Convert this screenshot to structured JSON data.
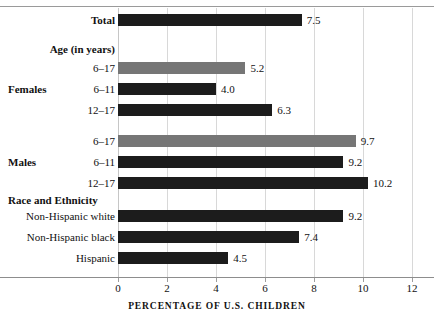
{
  "chart_data": {
    "type": "bar",
    "orientation": "horizontal",
    "title": "",
    "xlabel": "PERCENTAGE OF U.S. CHILDREN",
    "ylabel": "",
    "xlim": [
      0,
      12
    ],
    "xticks": [
      0,
      2,
      4,
      6,
      8,
      10,
      12
    ],
    "xtick_labels": [
      "0",
      "2",
      "4",
      "6",
      "8",
      "10",
      "12"
    ],
    "grid": true,
    "grid_axis": "x",
    "legend": "none",
    "colors": {
      "dark_bar": "#1c1c1c",
      "gray_bar": "#767676",
      "gridline": "#d8d8d8",
      "axis": "#8d8d8d",
      "text": "#111111",
      "background": "#ffffff"
    },
    "categories": [
      "Total",
      "Females 6–17",
      "Females 6–11",
      "Females 12–17",
      "Males 6–17",
      "Males 6–11",
      "Males 12–17",
      "Non-Hispanic white",
      "Non-Hispanic black",
      "Hispanic"
    ],
    "values": [
      7.5,
      5.2,
      4.0,
      6.3,
      9.7,
      9.2,
      10.2,
      9.2,
      7.4,
      4.5
    ]
  },
  "section_headings": {
    "age": "Age (in years)",
    "race": "Race and Ethnicity"
  },
  "side_labels": {
    "females": "Females",
    "males": "Males"
  },
  "rows": [
    {
      "label": "Total",
      "label_bold": true,
      "value": 7.5,
      "value_text": "7.5",
      "shade": "dark"
    },
    {
      "label": "6–17",
      "label_bold": false,
      "value": 5.2,
      "value_text": "5.2",
      "shade": "gray"
    },
    {
      "label": "6–11",
      "label_bold": false,
      "value": 4.0,
      "value_text": "4.0",
      "shade": "dark"
    },
    {
      "label": "12–17",
      "label_bold": false,
      "value": 6.3,
      "value_text": "6.3",
      "shade": "dark"
    },
    {
      "label": "6–17",
      "label_bold": false,
      "value": 9.7,
      "value_text": "9.7",
      "shade": "gray"
    },
    {
      "label": "6–11",
      "label_bold": false,
      "value": 9.2,
      "value_text": "9.2",
      "shade": "dark"
    },
    {
      "label": "12–17",
      "label_bold": false,
      "value": 10.2,
      "value_text": "10.2",
      "shade": "dark"
    },
    {
      "label": "Non-Hispanic white",
      "label_bold": false,
      "value": 9.2,
      "value_text": "9.2",
      "shade": "dark"
    },
    {
      "label": "Non-Hispanic black",
      "label_bold": false,
      "value": 7.4,
      "value_text": "7.4",
      "shade": "dark"
    },
    {
      "label": "Hispanic",
      "label_bold": false,
      "value": 4.5,
      "value_text": "4.5",
      "shade": "dark"
    }
  ]
}
